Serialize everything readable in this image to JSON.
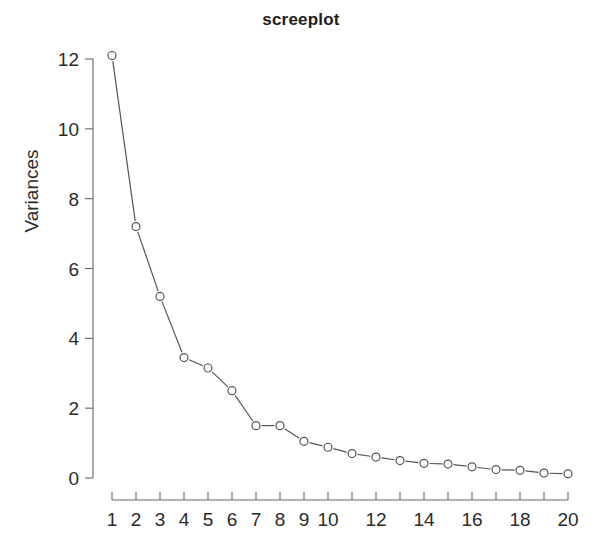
{
  "chart": {
    "title": "screeplot",
    "ylabel": "Variances",
    "xlabel": ""
  },
  "chart_data": {
    "type": "line",
    "title": "screeplot",
    "xlabel": "",
    "ylabel": "Variances",
    "x": [
      1,
      2,
      3,
      4,
      5,
      6,
      7,
      8,
      9,
      10,
      11,
      12,
      13,
      14,
      15,
      16,
      17,
      18,
      19,
      20
    ],
    "values": [
      12.1,
      7.2,
      5.2,
      3.45,
      3.15,
      2.5,
      1.5,
      1.5,
      1.05,
      0.88,
      0.7,
      0.6,
      0.5,
      0.42,
      0.4,
      0.32,
      0.24,
      0.22,
      0.14,
      0.12
    ],
    "series": [
      {
        "name": "Variances",
        "values": [
          12.1,
          7.2,
          5.2,
          3.45,
          3.15,
          2.5,
          1.5,
          1.5,
          1.05,
          0.88,
          0.7,
          0.6,
          0.5,
          0.42,
          0.4,
          0.32,
          0.24,
          0.22,
          0.14,
          0.12
        ]
      }
    ],
    "xlim": [
      1,
      20
    ],
    "ylim": [
      0,
      12.1
    ],
    "xticks": [
      1,
      2,
      3,
      4,
      5,
      6,
      7,
      8,
      9,
      10,
      11,
      12,
      13,
      14,
      15,
      16,
      17,
      18,
      19,
      20
    ],
    "xticklabels": [
      "1",
      "2",
      "3",
      "4",
      "5",
      "6",
      "7",
      "8",
      "9",
      "10",
      "",
      "12",
      "",
      "14",
      "",
      "16",
      "",
      "18",
      "",
      "20"
    ],
    "yticks": [
      0,
      2,
      4,
      6,
      8,
      10,
      12
    ],
    "yticklabels": [
      "0",
      "2",
      "4",
      "6",
      "8",
      "10",
      "12"
    ],
    "grid": false,
    "legend": false,
    "marker": "open-circle",
    "line_color": "#555555",
    "marker_color": "#555555",
    "background": "#ffffff"
  }
}
